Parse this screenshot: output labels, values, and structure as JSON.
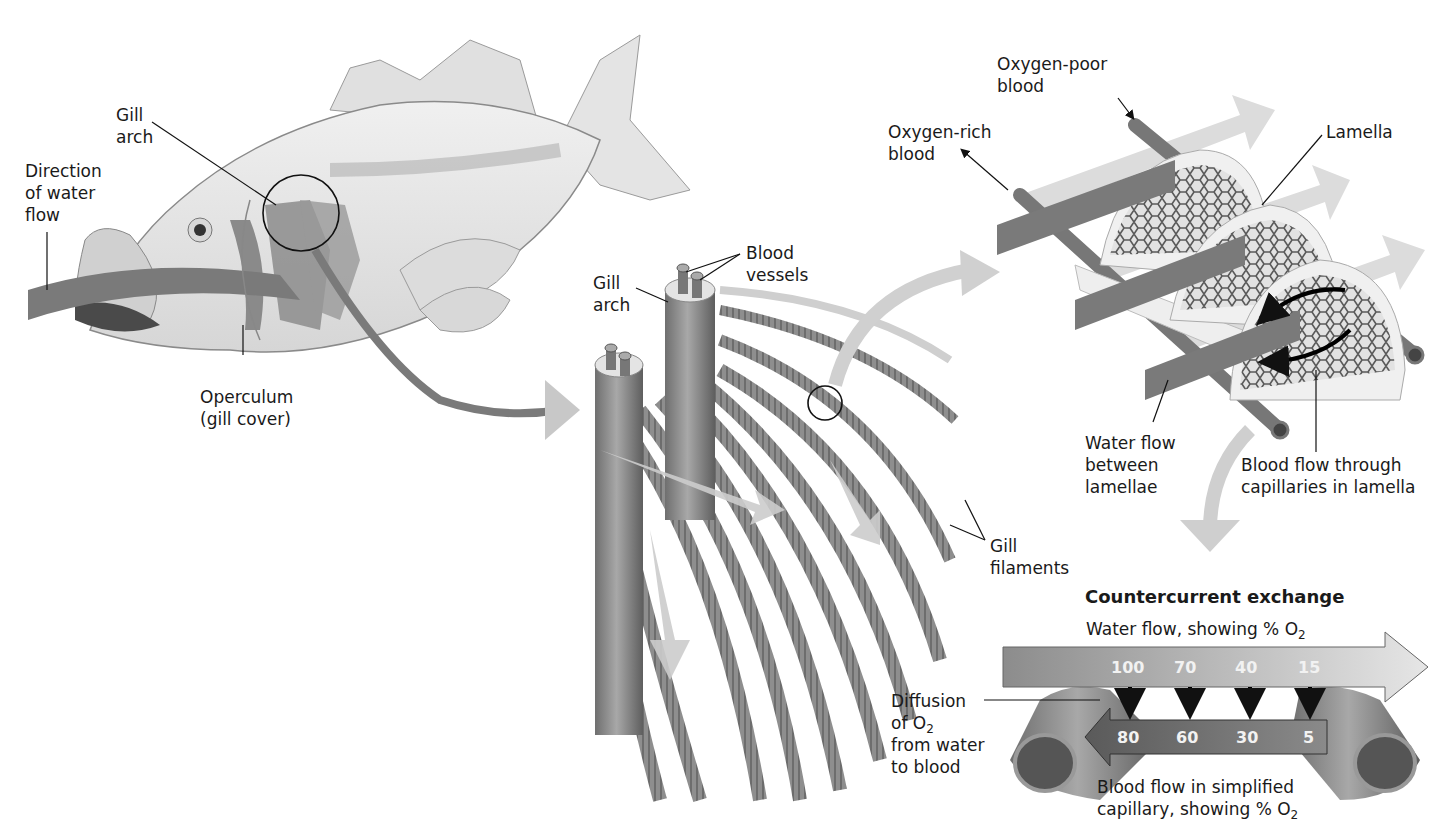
{
  "figure": {
    "colors": {
      "gill_tissue": "#8a8a8a",
      "water_arrow": "#cfcfcf",
      "vessel": "#7d7d7d",
      "lamella_plate": "#efefef",
      "text": "#1a1a1a"
    }
  },
  "fish_panel": {
    "labels": {
      "gill_arch_1": "Gill",
      "gill_arch_2": "arch",
      "water_flow_1": "Direction",
      "water_flow_2": "of water",
      "water_flow_3": "flow",
      "operculum_1": "Operculum",
      "operculum_2": "(gill cover)"
    }
  },
  "gill_arch_panel": {
    "labels": {
      "gill_arch_1": "Gill",
      "gill_arch_2": "arch",
      "blood_vessels_1": "Blood",
      "blood_vessels_2": "vessels",
      "gill_filaments_1": "Gill",
      "gill_filaments_2": "filaments"
    }
  },
  "lamella_panel": {
    "labels": {
      "oxygen_poor_1": "Oxygen-poor",
      "oxygen_poor_2": "blood",
      "oxygen_rich_1": "Oxygen-rich",
      "oxygen_rich_2": "blood",
      "lamella": "Lamella",
      "water_between_1": "Water flow",
      "water_between_2": "between",
      "water_between_3": "lamellae",
      "blood_capillaries_1": "Blood flow through",
      "blood_capillaries_2": "capillaries in lamella"
    }
  },
  "countercurrent_panel": {
    "title": "Countercurrent exchange",
    "water_label": "Water flow, showing % O",
    "water_label_sub": "2",
    "blood_label_1": "Blood flow in simplified",
    "blood_label_2": "capillary, showing % O",
    "blood_label_sub": "2",
    "diffusion_1": "Diffusion",
    "diffusion_2": "of O",
    "diffusion_2_sub": "2",
    "diffusion_3": "from water",
    "diffusion_4": "to blood",
    "water_o2_percent": [
      "100",
      "70",
      "40",
      "15"
    ],
    "blood_o2_percent": [
      "80",
      "60",
      "30",
      "5"
    ]
  }
}
